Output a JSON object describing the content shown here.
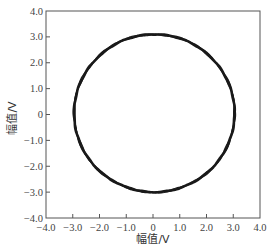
{
  "chart_data": {
    "type": "line",
    "subtype": "parametric-circle (Lissajous / phase trajectory)",
    "title": "",
    "xlabel": "幅值/V",
    "ylabel": "幅值/V",
    "xlim": [
      -4.0,
      4.0
    ],
    "ylim": [
      -4.0,
      4.0
    ],
    "xticks": [
      -4.0,
      -3.0,
      -2.0,
      -1.0,
      0,
      1.0,
      2.0,
      3.0,
      4.0
    ],
    "yticks": [
      -4.0,
      -3.0,
      -2.0,
      -1.0,
      0,
      1.0,
      2.0,
      3.0,
      4.0
    ],
    "xtick_labels": [
      "-4.0",
      "-3.0",
      "-2.0",
      "-1.0",
      "0",
      "1.0",
      "2.0",
      "3.0",
      "4.0"
    ],
    "ytick_labels": [
      "-4.0",
      "-3.0",
      "-2.0",
      "-1.0",
      "0",
      "1.0",
      "2.0",
      "3.0",
      "4.0"
    ],
    "grid": false,
    "legend": null,
    "tick_direction": "in",
    "series": [
      {
        "name": "trajectory",
        "color": "#1a1a1a",
        "shape": "circle",
        "center": [
          0.05,
          0.05
        ],
        "radius_x": 3.0,
        "radius_y": 3.05,
        "extent": {
          "x_min": -2.95,
          "x_max": 3.0,
          "y_min": -3.0,
          "y_max": 3.1
        },
        "sample_points": {
          "x": [
            3.0,
            2.6,
            1.55,
            0.05,
            -1.45,
            -2.55,
            -2.95,
            -2.55,
            -1.45,
            0.05,
            1.55,
            2.6,
            3.0
          ],
          "y": [
            0.05,
            1.58,
            2.69,
            3.1,
            2.69,
            1.58,
            0.05,
            -1.48,
            -2.59,
            -3.0,
            -2.59,
            -1.48,
            0.05
          ]
        }
      }
    ]
  }
}
